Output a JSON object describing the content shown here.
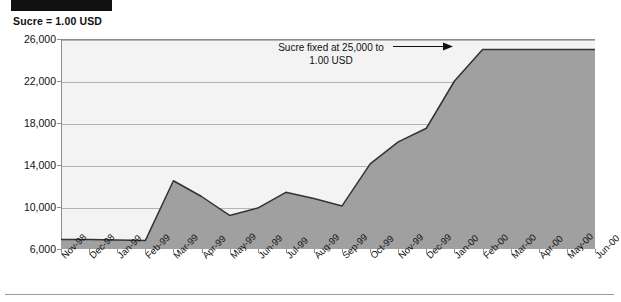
{
  "figure": {
    "redaction_bar": "redacted-title-banner",
    "unit_label": "Sucre = 1.00 USD",
    "bottom_rule": "horizontal-divider"
  },
  "annotation": {
    "line_1": "Sucre fixed at 25,000 to",
    "line_2": "1.00 USD",
    "arrow": "right-arrow"
  },
  "colors": {
    "area_fill": "#a0a0a0",
    "area_line": "#333333",
    "plot_background": "#f3f3f3",
    "gridline": "#b4b4b4",
    "axis": "#6f6f6f",
    "text": "#111111",
    "redaction": "#111111"
  },
  "chart_data": {
    "type": "area",
    "title": "",
    "subtitle": "Sucre = 1.00 USD",
    "xlabel": "",
    "ylabel": "",
    "ylim": [
      6000,
      26000
    ],
    "yticks": [
      6000,
      10000,
      14000,
      18000,
      22000,
      26000
    ],
    "ytick_labels": [
      "6,000",
      "10,000",
      "14,000",
      "18,000",
      "22,000",
      "26,000"
    ],
    "grid": true,
    "legend": false,
    "categories": [
      "Nov-98",
      "Dec-98",
      "Jan-99",
      "Feb-99",
      "Mar-99",
      "Apr-99",
      "May-99",
      "Jun-99",
      "Jul-99",
      "Aug-99",
      "Sep-99",
      "Oct-99",
      "Nov-99",
      "Dec-99",
      "Jan-00",
      "Feb-00",
      "Mar-00",
      "Apr-00",
      "May-00",
      "Jun-00"
    ],
    "values": [
      6900,
      6900,
      6850,
      6800,
      12500,
      11000,
      9200,
      9900,
      11400,
      10800,
      10100,
      14100,
      16200,
      17500,
      22000,
      25000,
      25000,
      25000,
      25000,
      25000
    ],
    "annotations": [
      {
        "text": "Sucre fixed at 25,000 to 1.00 USD",
        "points_to_category": "Feb-00",
        "points_to_value": 25000
      }
    ]
  }
}
